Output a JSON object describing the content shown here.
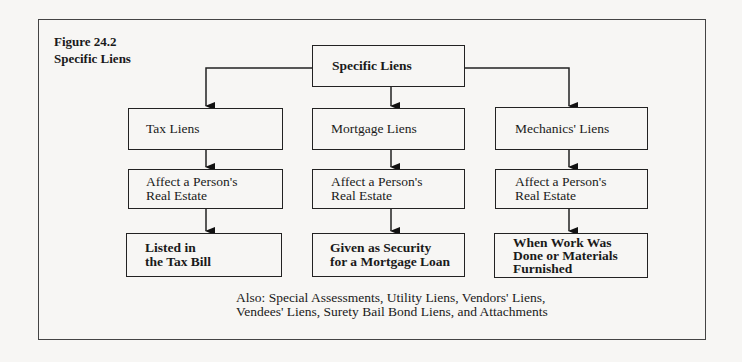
{
  "figure": {
    "number": "Figure 24.2",
    "title": "Specific Liens"
  },
  "root": {
    "label": "Specific Liens"
  },
  "columns": [
    {
      "type": "Tax Liens",
      "affects": "Affect a Person's\nReal Estate",
      "detail": "Listed in\nthe Tax Bill"
    },
    {
      "type": "Mortgage Liens",
      "affects": "Affect a Person's\nReal Estate",
      "detail": "Given as Security\nfor a Mortgage Loan"
    },
    {
      "type": "Mechanics' Liens",
      "affects": "Affect a Person's\nReal Estate",
      "detail": "When Work Was\nDone or Materials\nFurnished"
    }
  ],
  "footnote": "Also:  Special Assessments, Utility Liens, Vendors' Liens,\nVendees' Liens, Surety Bail Bond Liens, and Attachments"
}
